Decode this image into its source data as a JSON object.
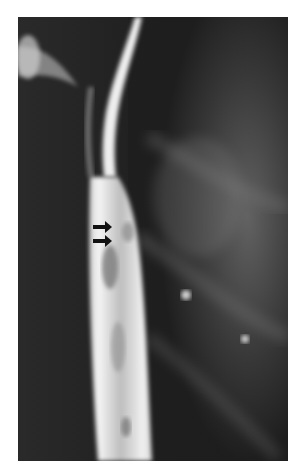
{
  "image": {
    "type": "radiograph",
    "description": "Barium swallow radiograph of the esophagus with two black arrows pointing at a mucosal irregularity",
    "annotations": [
      {
        "kind": "arrow",
        "direction": "right",
        "label": ""
      },
      {
        "kind": "arrow",
        "direction": "right",
        "label": ""
      }
    ],
    "colors": {
      "background": "#ffffff",
      "film_dark": "#1a1a1a",
      "contrast_bright": "#f2f2f2",
      "arrow": "#111111"
    }
  }
}
